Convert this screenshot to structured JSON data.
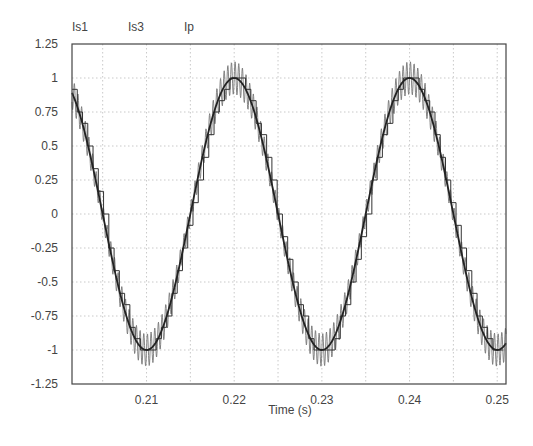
{
  "chart_data": {
    "type": "line",
    "title": "",
    "xlabel": "Time (s)",
    "ylabel": "",
    "xlim": [
      0.2015,
      0.251
    ],
    "ylim": [
      -1.25,
      1.25
    ],
    "grid": true,
    "legend_position": "top-left",
    "x_ticks": [
      "0.21",
      "0.22",
      "0.23",
      "0.24",
      "0.25"
    ],
    "x_tick_values": [
      0.21,
      0.22,
      0.23,
      0.24,
      0.25
    ],
    "y_ticks": [
      "1.25",
      "1",
      "0.75",
      "0.5",
      "0.25",
      "0",
      "-0.25",
      "-0.5",
      "-0.75",
      "-1",
      "-1.25"
    ],
    "y_tick_values": [
      1.25,
      1,
      0.75,
      0.5,
      0.25,
      0,
      -0.25,
      -0.5,
      -0.75,
      -1,
      -1.25
    ],
    "series": [
      {
        "name": "Is1",
        "description": "sinusoid with high-frequency switching ripple (~±0.12)",
        "frequency_hz": 50,
        "amplitude": 1.0,
        "ripple_amplitude": 0.12,
        "color": "#777777"
      },
      {
        "name": "Is3",
        "description": "staircase approximation of sinusoid",
        "frequency_hz": 50,
        "amplitude": 1.0,
        "color": "#333333"
      },
      {
        "name": "Ip",
        "description": "smooth fundamental sinusoid, peaks at t=0.20,0.22,0.24; troughs at 0.21,0.23,0.25",
        "frequency_hz": 50,
        "amplitude": 1.0,
        "color": "#222222"
      }
    ]
  },
  "legend": {
    "items": [
      "Is1",
      "Is3",
      "Ip"
    ]
  },
  "axes": {
    "xlabel": "Time (s)"
  }
}
